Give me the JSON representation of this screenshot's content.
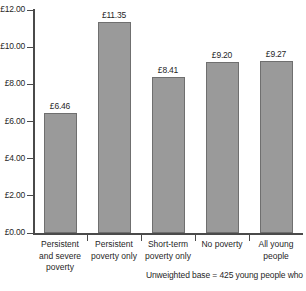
{
  "chart_data": {
    "type": "bar",
    "title": "",
    "subtitle": "",
    "xlabel": "",
    "ylabel": "",
    "ylim": [
      0,
      12
    ],
    "grid": false,
    "legend": "none",
    "bar_color": "#9a9a9a",
    "bar_border_color": "#6f6f6f",
    "axis_color": "#4a4a4a",
    "categories": [
      "Persistent and severe poverty",
      "Persistent poverty only",
      "Short-term poverty only",
      "No poverty",
      "All young people"
    ],
    "category_lines": [
      [
        "Persistent",
        "and severe",
        "poverty"
      ],
      [
        "Persistent",
        "poverty only"
      ],
      [
        "Short-term",
        "poverty only"
      ],
      [
        "No poverty"
      ],
      [
        "All young",
        "people"
      ]
    ],
    "values": [
      6.46,
      11.35,
      8.41,
      9.2,
      9.27
    ],
    "value_labels": [
      "£6.46",
      "£11.35",
      "£8.41",
      "£9.20",
      "£9.27"
    ],
    "y_ticks": [
      0,
      2,
      4,
      6,
      8,
      10,
      12
    ],
    "y_tick_labels": [
      "£0.00",
      "£2.00",
      "£4.00",
      "£6.00",
      "£8.00",
      "£10.00",
      "£12.00"
    ]
  },
  "footnote": {
    "text": "Unweighted base = 425 young people who"
  }
}
